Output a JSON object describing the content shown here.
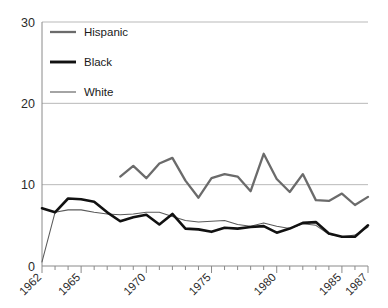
{
  "chart_data": {
    "type": "line",
    "title": "",
    "subtitle": "",
    "xlabel": "",
    "ylabel": "",
    "xlim": [
      1962,
      1987
    ],
    "ylim": [
      0,
      30
    ],
    "yticks": [
      0,
      10,
      20,
      30
    ],
    "ytick_labels": [
      "0",
      "10",
      "20",
      "30"
    ],
    "xticks": [
      1962,
      1965,
      1970,
      1975,
      1980,
      1985,
      1987
    ],
    "xtick_labels": [
      "1962",
      "1965",
      "1970",
      "1975",
      "1980",
      "1985",
      "1987"
    ],
    "xtick_minor_every": 1,
    "grid": "horizontal",
    "legend_position": "top-left",
    "x": [
      1962,
      1963,
      1964,
      1965,
      1966,
      1967,
      1968,
      1969,
      1970,
      1971,
      1972,
      1973,
      1974,
      1975,
      1976,
      1977,
      1978,
      1979,
      1980,
      1981,
      1982,
      1983,
      1984,
      1985,
      1986,
      1987
    ],
    "series": [
      {
        "name": "Hispanic",
        "color": "#6b6b6b",
        "x": [
          1968,
          1969,
          1970,
          1971,
          1972,
          1973,
          1974,
          1975,
          1976,
          1977,
          1978,
          1979,
          1980,
          1981,
          1982,
          1983,
          1984,
          1985,
          1986,
          1987
        ],
        "values": [
          11.0,
          12.3,
          10.8,
          12.6,
          13.3,
          10.5,
          8.4,
          10.8,
          11.3,
          11.0,
          9.2,
          13.8,
          10.7,
          9.1,
          11.3,
          8.1,
          8.0,
          8.9,
          7.5,
          8.5
        ]
      },
      {
        "name": "Black",
        "color": "#111111",
        "x": [
          1962,
          1963,
          1964,
          1965,
          1966,
          1967,
          1968,
          1969,
          1970,
          1971,
          1972,
          1973,
          1974,
          1975,
          1976,
          1977,
          1978,
          1979,
          1980,
          1981,
          1982,
          1983,
          1984,
          1985,
          1986,
          1987
        ],
        "values": [
          7.1,
          6.6,
          8.3,
          8.2,
          7.9,
          6.6,
          5.5,
          6.0,
          6.3,
          5.1,
          6.4,
          4.6,
          4.5,
          4.2,
          4.7,
          4.6,
          4.8,
          4.9,
          4.1,
          4.6,
          5.3,
          5.4,
          4.0,
          3.6,
          3.6,
          5.0
        ]
      },
      {
        "name": "White",
        "color": "#5a5a5a",
        "x": [
          1962,
          1963,
          1964,
          1965,
          1966,
          1967,
          1968,
          1969,
          1970,
          1971,
          1972,
          1973,
          1974,
          1975,
          1976,
          1977,
          1978,
          1979,
          1980,
          1981,
          1982,
          1983,
          1984,
          1985,
          1986,
          1987
        ],
        "values": [
          0.5,
          6.6,
          6.9,
          6.9,
          6.6,
          6.4,
          6.3,
          6.4,
          6.6,
          6.6,
          6.1,
          5.6,
          5.4,
          5.5,
          5.6,
          5.1,
          4.9,
          5.3,
          4.9,
          4.6,
          5.2,
          5.0,
          3.9,
          3.6,
          3.8,
          4.8
        ]
      }
    ],
    "legend": [
      {
        "label": "Hispanic",
        "style": "medium-gray-thick"
      },
      {
        "label": "Black",
        "style": "black-thick"
      },
      {
        "label": "White",
        "style": "gray-thin"
      }
    ]
  },
  "colors": {
    "background": "#ffffff",
    "grid": "#b9b9b9",
    "axis": "#8a8a8a",
    "hispanic": "#6b6b6b",
    "black": "#111111",
    "white": "#5a5a5a",
    "text": "#1a1a1a"
  }
}
